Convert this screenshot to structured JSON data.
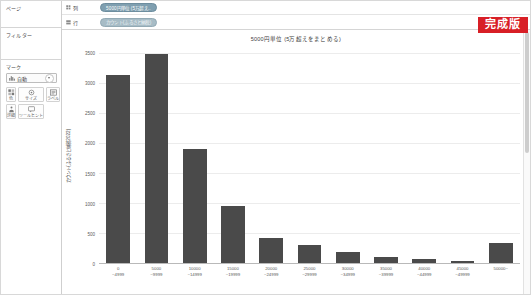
{
  "sidebar": {
    "pages": {
      "title": "ページ"
    },
    "filters": {
      "title": "フィルター"
    },
    "marks": {
      "title": "マーク",
      "type_selector": {
        "icon": "bar-mark-icon",
        "value": "自動"
      },
      "buttons": [
        {
          "icon": "color-icon",
          "label": "色"
        },
        {
          "icon": "size-icon",
          "label": "サイズ"
        },
        {
          "icon": "label-icon",
          "label": "ラベル"
        },
        {
          "icon": "detail-icon",
          "label": "詳細"
        },
        {
          "icon": "tooltip-icon",
          "label": "ツールヒント"
        }
      ]
    }
  },
  "shelves": [
    {
      "name": "columns",
      "label": "列",
      "pill": {
        "text": "5000円単位 (5万超え..",
        "kind": "dim"
      }
    },
    {
      "name": "rows",
      "label": "行",
      "pill": {
        "text": "カウント(ふるさと納税)",
        "kind": "meas"
      }
    }
  ],
  "badge": {
    "text": "完成版",
    "color": "#d81f26"
  },
  "chart_data": {
    "type": "bar",
    "title": "5000円単位 (5万超えをまとめる)",
    "xlabel": "",
    "ylabel": "カウント(ふるさと納税2022)",
    "ylim": [
      0,
      3600
    ],
    "yticks": [
      0,
      500,
      1000,
      1500,
      2000,
      2500,
      3000,
      3500
    ],
    "grid": true,
    "legend": "none",
    "bar_color": "#4a4a4a",
    "categories": [
      "0\n~4999",
      "5000\n~9999",
      "10000\n~14999",
      "15000\n~19999",
      "20000\n~24999",
      "25000\n~29999",
      "30000\n~34999",
      "35000\n~39999",
      "40000\n~44999",
      "45000\n~49999",
      "50000~"
    ],
    "category_lines": [
      {
        "l1": "0",
        "l2": "~4999"
      },
      {
        "l1": "5000",
        "l2": "~9999"
      },
      {
        "l1": "10000",
        "l2": "~14999"
      },
      {
        "l1": "15000",
        "l2": "~19999"
      },
      {
        "l1": "20000",
        "l2": "~24999"
      },
      {
        "l1": "25000",
        "l2": "~29999"
      },
      {
        "l1": "30000",
        "l2": "~34999"
      },
      {
        "l1": "35000",
        "l2": "~39999"
      },
      {
        "l1": "40000",
        "l2": "~44999"
      },
      {
        "l1": "45000",
        "l2": "~49999"
      },
      {
        "l1": "50000~",
        "l2": ""
      }
    ],
    "values": [
      3140,
      3490,
      1900,
      950,
      420,
      300,
      190,
      105,
      60,
      40,
      330
    ]
  }
}
